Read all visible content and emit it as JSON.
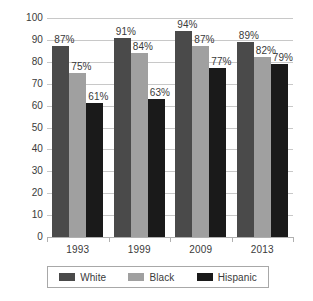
{
  "chart_data": {
    "type": "bar",
    "title": "",
    "subtitle": "",
    "xlabel": "",
    "ylabel": "",
    "categories": [
      "1993",
      "1999",
      "2009",
      "2013"
    ],
    "series": [
      {
        "name": "White",
        "color": "#4a4a4a",
        "values": [
          87,
          91,
          94,
          89
        ],
        "labels": [
          "87%",
          "91%",
          "94%",
          "89%"
        ]
      },
      {
        "name": "Black",
        "color": "#a0a0a0",
        "values": [
          75,
          84,
          87,
          82
        ],
        "labels": [
          "75%",
          "84%",
          "87%",
          "82%"
        ]
      },
      {
        "name": "Hispanic",
        "color": "#1a1a1a",
        "values": [
          61,
          63,
          77,
          79
        ],
        "labels": [
          "61%",
          "63%",
          "77%",
          "79%"
        ]
      }
    ],
    "ylim": [
      0,
      100
    ],
    "y_ticks": [
      0,
      10,
      20,
      30,
      40,
      50,
      60,
      70,
      80,
      90,
      100
    ],
    "y_tick_labels": [
      "0",
      "10",
      "20",
      "30",
      "40",
      "50",
      "60",
      "70",
      "80",
      "90",
      "100"
    ],
    "grid": true,
    "grid_color": "#c8c8c8",
    "legend_position": "bottom",
    "background": "#ffffff",
    "value_suffix": "%"
  },
  "legend": {
    "entries": [
      {
        "label": "White"
      },
      {
        "label": "Black"
      },
      {
        "label": "Hispanic"
      }
    ]
  }
}
